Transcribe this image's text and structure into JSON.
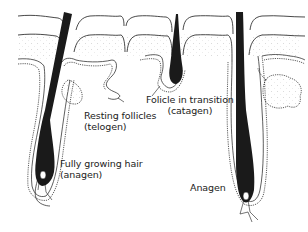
{
  "labels": {
    "telogen": {
      "line1": "Resting follicles",
      "line2": "(telogen)"
    },
    "catagen": {
      "line1": "Folicle in transition",
      "line2": "(catagen)"
    },
    "anagen_left": {
      "line1": "Fully growing hair",
      "line2": "(anagen)"
    },
    "anagen_right": {
      "line1": "Anagen"
    }
  },
  "colors": {
    "ink": "#1a1a1a",
    "background": "#ffffff",
    "stipple": "#c8c8c8"
  }
}
